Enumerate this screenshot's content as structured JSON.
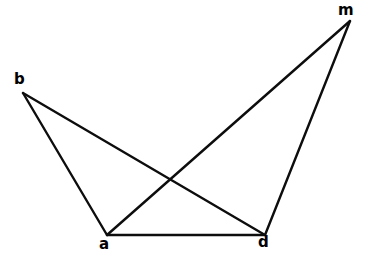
{
  "figure": {
    "kind": "geometric-line-diagram",
    "width": 372,
    "height": 261,
    "background_color": "#FFFFFF",
    "stroke_color": "#0D0D0D",
    "stroke_width": 2.4,
    "label_color": "#000000"
  },
  "vertices": [
    {
      "id": "b",
      "label": "b",
      "x": 23,
      "y": 93,
      "label_x": 14,
      "label_y": 72
    },
    {
      "id": "m",
      "label": "m",
      "x": 350,
      "y": 21,
      "label_x": 338,
      "label_y": 3
    },
    {
      "id": "a",
      "label": "a",
      "x": 107,
      "y": 235,
      "label_x": 99,
      "label_y": 237
    },
    {
      "id": "d",
      "label": "d",
      "x": 265,
      "y": 235,
      "label_x": 258,
      "label_y": 235
    }
  ],
  "edges": [
    {
      "id": "edge-b-a",
      "from": "b",
      "to": "a",
      "x1": 23,
      "y1": 93,
      "x2": 107,
      "y2": 235
    },
    {
      "id": "edge-b-d",
      "from": "b",
      "to": "d",
      "x1": 23,
      "y1": 93,
      "x2": 265,
      "y2": 235
    },
    {
      "id": "edge-a-d",
      "from": "a",
      "to": "d",
      "x1": 107,
      "y1": 235,
      "x2": 265,
      "y2": 235
    },
    {
      "id": "edge-a-m",
      "from": "a",
      "to": "m",
      "x1": 107,
      "y1": 235,
      "x2": 350,
      "y2": 21
    },
    {
      "id": "edge-m-d",
      "from": "m",
      "to": "d",
      "x1": 350,
      "y1": 21,
      "x2": 265,
      "y2": 235
    }
  ],
  "intersections": [
    {
      "id": "crossing-bd-am",
      "of": [
        "edge-b-d",
        "edge-a-m"
      ],
      "x": 170,
      "y": 180
    }
  ]
}
